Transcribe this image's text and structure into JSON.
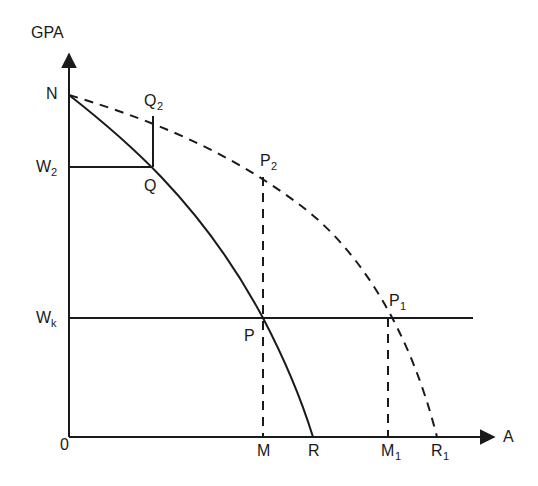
{
  "diagram": {
    "axes": {
      "y_label": "GPA",
      "x_label": "A",
      "origin_label": "0"
    },
    "points": {
      "N": {
        "label": "N"
      },
      "Q": {
        "label": "Q"
      },
      "Q2": {
        "label": "Q",
        "sub": "2"
      },
      "W2": {
        "label": "W",
        "sub": "2"
      },
      "P2": {
        "label": "P",
        "sub": "2"
      },
      "P": {
        "label": "P"
      },
      "P1": {
        "label": "P",
        "sub": "1"
      },
      "Wk": {
        "label": "W",
        "sub": "k"
      },
      "M": {
        "label": "M"
      },
      "R": {
        "label": "R"
      },
      "M1": {
        "label": "M",
        "sub": "1"
      },
      "R1": {
        "label": "R",
        "sub": "1"
      }
    },
    "curves": [
      {
        "name": "solid-curve-NR",
        "style": "solid",
        "from": "N",
        "to": "R"
      },
      {
        "name": "dashed-curve-NR1",
        "style": "dashed",
        "from": "N",
        "to": "R1"
      }
    ],
    "lines": [
      {
        "name": "W2-horizontal",
        "style": "solid",
        "from": "W2",
        "to": "Q"
      },
      {
        "name": "Q-Q2-vertical",
        "style": "solid",
        "from": "Q",
        "to": "Q2"
      },
      {
        "name": "Wk-horizontal",
        "style": "solid",
        "from": "Wk",
        "through": [
          "P",
          "P1"
        ]
      },
      {
        "name": "P2-M-vertical",
        "style": "dashed",
        "from": "P2",
        "to": "M"
      },
      {
        "name": "P1-M1-vertical",
        "style": "dashed",
        "from": "P1",
        "to": "M1"
      }
    ],
    "colors": {
      "ink": "#1a1a1a",
      "background": "#ffffff"
    }
  }
}
